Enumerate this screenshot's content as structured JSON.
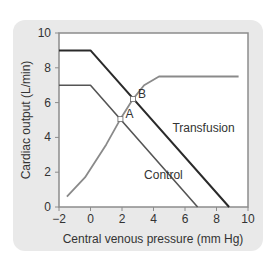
{
  "chart_data": {
    "type": "line",
    "title": "",
    "xlabel": "Central venous pressure (mm Hg)",
    "ylabel": "Cardiac output (L/min)",
    "xlim": [
      -2,
      10
    ],
    "ylim": [
      0,
      10
    ],
    "xticks": [
      -2,
      0,
      2,
      4,
      6,
      8,
      10
    ],
    "yticks": [
      0,
      2,
      4,
      6,
      8,
      10
    ],
    "grid": false,
    "series": [
      {
        "name": "Transfusion",
        "color": "#2a2a2a",
        "width": 2,
        "points": [
          [
            -2,
            9
          ],
          [
            0,
            9
          ],
          [
            8.8,
            0
          ]
        ]
      },
      {
        "name": "Control",
        "color": "#555555",
        "width": 1.6,
        "points": [
          [
            -2,
            7
          ],
          [
            0,
            7
          ],
          [
            6.8,
            0
          ]
        ]
      },
      {
        "name": "Cardiac function curve",
        "color": "#8a8a8a",
        "width": 1.8,
        "points": [
          [
            -1.5,
            0.6
          ],
          [
            -0.35,
            1.7
          ],
          [
            1.0,
            3.6
          ],
          [
            1.9,
            5.05
          ],
          [
            2.7,
            6.2
          ],
          [
            3.4,
            7.0
          ],
          [
            4.35,
            7.5
          ],
          [
            9.4,
            7.5
          ]
        ]
      }
    ],
    "annotations": [
      {
        "text": "A",
        "x": 1.9,
        "y": 5.05
      },
      {
        "text": "B",
        "x": 2.7,
        "y": 6.2
      },
      {
        "text": "Transfusion",
        "x": 5.2,
        "y": 4.3
      },
      {
        "text": "Control",
        "x": 3.4,
        "y": 1.6
      }
    ]
  }
}
